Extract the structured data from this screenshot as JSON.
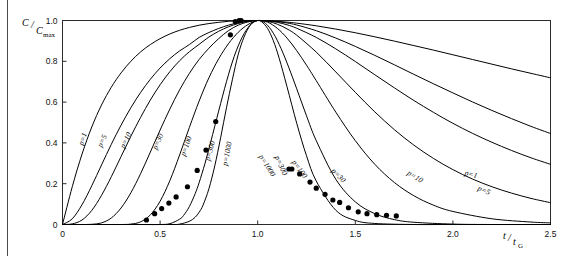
{
  "figure": {
    "background": "#ffffff",
    "frame_color": "#2b2b2b",
    "curve_color": "#000000",
    "marker_color": "#000000"
  },
  "axes": {
    "y_title_main": "C",
    "y_title_den": "C",
    "y_title_sub": "max",
    "x_title_num": "t",
    "x_title_den": "t",
    "x_title_sub": "G"
  },
  "chart_data": {
    "type": "line",
    "title": "",
    "subtitle": "",
    "xlabel": "t/tG",
    "ylabel": "C/Cmax",
    "xlim": [
      0,
      2.5
    ],
    "ylim": [
      0,
      1.0
    ],
    "grid": false,
    "legend_position": "inline-curve-labels",
    "xticks": [
      0,
      0.5,
      1.0,
      1.5,
      2.0,
      2.5
    ],
    "xticklabels": [
      "0",
      "0.5",
      "1.0",
      "1.5",
      "2.0",
      "2.5"
    ],
    "yticks": [
      0,
      0.2,
      0.4,
      0.6,
      0.8,
      1.0
    ],
    "yticklabels": [
      "0",
      "0.2",
      "0.4",
      "0.6",
      "0.8",
      "1.0"
    ],
    "parameter_name": "p",
    "series": [
      {
        "name": "p=1",
        "p": 1,
        "label_left": "p=1",
        "label_right": "p=1",
        "label_left_xy": [
          0.115,
          0.415
        ],
        "label_right_xy": [
          2.09,
          0.235
        ],
        "x": [
          0.0,
          0.05,
          0.1,
          0.15,
          0.2,
          0.25,
          0.3,
          0.35,
          0.4,
          0.45,
          0.5,
          0.55,
          0.6,
          0.65,
          0.7,
          0.75,
          0.8,
          0.85,
          0.9,
          0.95,
          1.0,
          1.05,
          1.1,
          1.15,
          1.2,
          1.3,
          1.4,
          1.5,
          1.6,
          1.7,
          1.8,
          1.9,
          2.0,
          2.1,
          2.2,
          2.3,
          2.4,
          2.5
        ],
        "y": [
          0.0,
          0.185,
          0.345,
          0.478,
          0.586,
          0.673,
          0.743,
          0.8,
          0.846,
          0.882,
          0.911,
          0.934,
          0.952,
          0.966,
          0.977,
          0.985,
          0.991,
          0.996,
          0.999,
          1.0,
          1.0,
          0.999,
          0.996,
          0.992,
          0.987,
          0.974,
          0.958,
          0.94,
          0.92,
          0.899,
          0.877,
          0.855,
          0.832,
          0.809,
          0.786,
          0.763,
          0.741,
          0.719
        ]
      },
      {
        "name": "p=5",
        "p": 5,
        "label_left": "p=5",
        "label_right": "p=5",
        "label_left_xy": [
          0.215,
          0.405
        ],
        "label_right_xy": [
          2.155,
          0.157
        ],
        "x": [
          0.0,
          0.05,
          0.1,
          0.15,
          0.2,
          0.25,
          0.3,
          0.35,
          0.4,
          0.45,
          0.5,
          0.55,
          0.6,
          0.65,
          0.7,
          0.75,
          0.8,
          0.85,
          0.9,
          0.95,
          1.0,
          1.05,
          1.1,
          1.15,
          1.2,
          1.3,
          1.4,
          1.5,
          1.6,
          1.7,
          1.8,
          1.9,
          2.0,
          2.1,
          2.2,
          2.3,
          2.4,
          2.5
        ],
        "y": [
          0.0,
          0.028,
          0.097,
          0.19,
          0.292,
          0.393,
          0.487,
          0.572,
          0.647,
          0.712,
          0.767,
          0.813,
          0.851,
          0.882,
          0.917,
          0.941,
          0.961,
          0.977,
          0.989,
          0.997,
          1.0,
          0.999,
          0.995,
          0.988,
          0.978,
          0.95,
          0.914,
          0.873,
          0.829,
          0.783,
          0.736,
          0.69,
          0.645,
          0.601,
          0.559,
          0.519,
          0.481,
          0.446
        ]
      },
      {
        "name": "p=10",
        "p": 10,
        "label_left": "p=10",
        "label_right": "p=10",
        "label_left_xy": [
          0.335,
          0.408
        ],
        "label_right_xy": [
          1.8,
          0.225
        ],
        "x": [
          0.0,
          0.05,
          0.1,
          0.15,
          0.2,
          0.25,
          0.3,
          0.35,
          0.4,
          0.45,
          0.5,
          0.55,
          0.6,
          0.65,
          0.7,
          0.75,
          0.8,
          0.85,
          0.9,
          0.95,
          1.0,
          1.05,
          1.1,
          1.15,
          1.2,
          1.3,
          1.4,
          1.5,
          1.6,
          1.7,
          1.8,
          1.9,
          2.0,
          2.1,
          2.2,
          2.3,
          2.4,
          2.5
        ],
        "y": [
          0.0,
          0.003,
          0.022,
          0.069,
          0.143,
          0.234,
          0.333,
          0.432,
          0.525,
          0.61,
          0.685,
          0.749,
          0.803,
          0.847,
          0.883,
          0.919,
          0.947,
          0.969,
          0.985,
          0.996,
          1.0,
          0.998,
          0.991,
          0.979,
          0.962,
          0.917,
          0.861,
          0.799,
          0.734,
          0.67,
          0.608,
          0.55,
          0.496,
          0.447,
          0.403,
          0.363,
          0.327,
          0.295
        ]
      },
      {
        "name": "p=30",
        "p": 30,
        "label_left": "p=30",
        "label_right": "p=30",
        "label_left_xy": [
          0.5,
          0.402
        ],
        "label_right_xy": [
          1.405,
          0.232
        ],
        "x": [
          0.0,
          0.05,
          0.1,
          0.15,
          0.2,
          0.25,
          0.3,
          0.35,
          0.4,
          0.45,
          0.5,
          0.55,
          0.6,
          0.65,
          0.7,
          0.75,
          0.8,
          0.85,
          0.9,
          0.95,
          1.0,
          1.05,
          1.1,
          1.15,
          1.2,
          1.3,
          1.4,
          1.5,
          1.6,
          1.7,
          1.8,
          1.9,
          2.0,
          2.1,
          2.2,
          2.3,
          2.4,
          2.5
        ],
        "y": [
          0.0,
          0.0,
          0.0,
          0.001,
          0.008,
          0.032,
          0.081,
          0.155,
          0.249,
          0.355,
          0.463,
          0.566,
          0.66,
          0.741,
          0.809,
          0.864,
          0.911,
          0.95,
          0.977,
          0.993,
          1.0,
          0.996,
          0.982,
          0.959,
          0.928,
          0.845,
          0.748,
          0.648,
          0.552,
          0.465,
          0.389,
          0.324,
          0.269,
          0.223,
          0.185,
          0.154,
          0.128,
          0.107
        ]
      },
      {
        "name": "p=100",
        "p": 100,
        "label_left": "p=100",
        "label_right": "p=100",
        "label_left_xy": [
          0.645,
          0.38
        ],
        "label_right_xy": [
          1.205,
          0.265
        ],
        "x": [
          0.0,
          0.1,
          0.2,
          0.3,
          0.35,
          0.4,
          0.45,
          0.5,
          0.55,
          0.6,
          0.65,
          0.7,
          0.75,
          0.8,
          0.85,
          0.9,
          0.95,
          1.0,
          1.05,
          1.1,
          1.15,
          1.2,
          1.25,
          1.3,
          1.4,
          1.5,
          1.6,
          1.7,
          1.8,
          1.9,
          2.0,
          2.2,
          2.4,
          2.5
        ],
        "y": [
          0.0,
          0.0,
          0.0,
          0.0,
          0.002,
          0.013,
          0.047,
          0.114,
          0.215,
          0.341,
          0.476,
          0.605,
          0.719,
          0.812,
          0.886,
          0.942,
          0.98,
          1.0,
          0.992,
          0.962,
          0.914,
          0.852,
          0.781,
          0.705,
          0.551,
          0.411,
          0.295,
          0.206,
          0.141,
          0.095,
          0.064,
          0.028,
          0.012,
          0.008
        ]
      },
      {
        "name": "p=300",
        "p": 300,
        "label_left": "p=300",
        "label_right": "p=300",
        "label_left_xy": [
          0.768,
          0.358
        ],
        "label_right_xy": [
          1.108,
          0.285
        ],
        "x": [
          0.0,
          0.2,
          0.4,
          0.5,
          0.55,
          0.6,
          0.62,
          0.65,
          0.68,
          0.7,
          0.73,
          0.76,
          0.8,
          0.84,
          0.88,
          0.92,
          0.96,
          1.0,
          1.04,
          1.08,
          1.12,
          1.16,
          1.2,
          1.25,
          1.3,
          1.4,
          1.5,
          1.6,
          1.7,
          1.8,
          2.0,
          2.2,
          2.5
        ],
        "y": [
          0.0,
          0.0,
          0.0,
          0.0,
          0.004,
          0.026,
          0.044,
          0.088,
          0.152,
          0.205,
          0.3,
          0.407,
          0.556,
          0.7,
          0.825,
          0.917,
          0.976,
          1.0,
          0.986,
          0.938,
          0.862,
          0.768,
          0.665,
          0.533,
          0.411,
          0.222,
          0.111,
          0.053,
          0.024,
          0.011,
          0.002,
          0.0,
          0.0
        ]
      },
      {
        "name": "p=1000",
        "p": 1000,
        "label_left": "p=1000",
        "label_right": "p=1000",
        "label_left_xy": [
          0.855,
          0.345
        ],
        "label_right_xy": [
          1.038,
          0.283
        ],
        "x": [
          0.0,
          0.3,
          0.55,
          0.6,
          0.65,
          0.68,
          0.7,
          0.72,
          0.75,
          0.78,
          0.81,
          0.84,
          0.87,
          0.9,
          0.93,
          0.96,
          0.98,
          1.0,
          1.02,
          1.05,
          1.08,
          1.11,
          1.15,
          1.2,
          1.25,
          1.3,
          1.4,
          1.5,
          1.6,
          1.8,
          2.0,
          2.5
        ],
        "y": [
          0.0,
          0.0,
          0.0,
          0.002,
          0.016,
          0.036,
          0.06,
          0.095,
          0.175,
          0.287,
          0.425,
          0.572,
          0.709,
          0.833,
          0.919,
          0.975,
          0.993,
          1.0,
          0.994,
          0.962,
          0.901,
          0.815,
          0.676,
          0.496,
          0.337,
          0.213,
          0.07,
          0.02,
          0.005,
          0.0,
          0.0,
          0.0
        ]
      }
    ],
    "scatter": {
      "name": "experimental points",
      "marker": "filled-circle",
      "points": [
        [
          0.43,
          0.022
        ],
        [
          0.472,
          0.053
        ],
        [
          0.508,
          0.078
        ],
        [
          0.545,
          0.105
        ],
        [
          0.582,
          0.135
        ],
        [
          0.64,
          0.185
        ],
        [
          0.69,
          0.265
        ],
        [
          0.735,
          0.365
        ],
        [
          0.785,
          0.505
        ],
        [
          0.86,
          0.93
        ],
        [
          0.885,
          0.995
        ],
        [
          0.905,
          1.0
        ],
        [
          0.915,
          1.0
        ],
        [
          1.16,
          0.272
        ],
        [
          1.175,
          0.272
        ],
        [
          1.215,
          0.248
        ],
        [
          1.268,
          0.208
        ],
        [
          1.3,
          0.178
        ],
        [
          1.345,
          0.148
        ],
        [
          1.385,
          0.12
        ],
        [
          1.42,
          0.108
        ],
        [
          1.465,
          0.082
        ],
        [
          1.515,
          0.062
        ],
        [
          1.56,
          0.053
        ],
        [
          1.61,
          0.048
        ],
        [
          1.66,
          0.045
        ],
        [
          1.71,
          0.042
        ]
      ]
    }
  }
}
